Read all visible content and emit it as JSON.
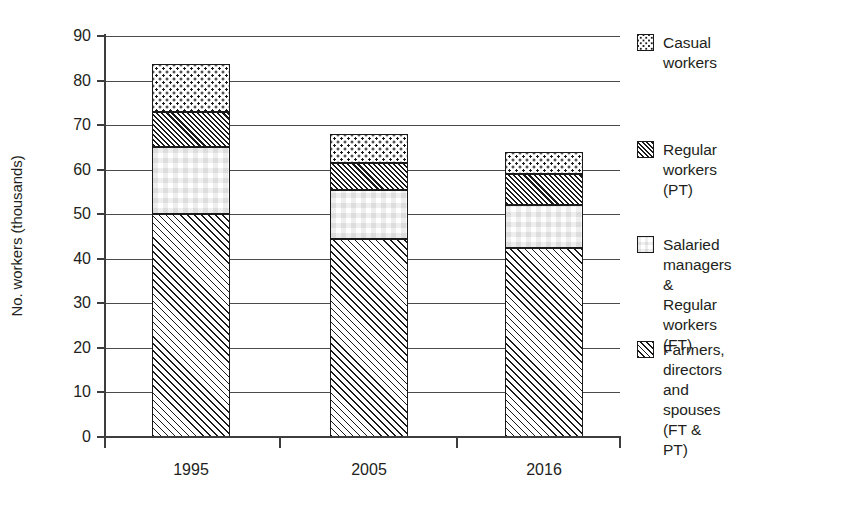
{
  "chart_data": {
    "type": "bar",
    "stacked": true,
    "title": "",
    "xlabel": "",
    "ylabel": "No. workers (thousands)",
    "categories": [
      "1995",
      "2005",
      "2016"
    ],
    "ylim": [
      0,
      90
    ],
    "ytick_step": 10,
    "yticks": [
      "90",
      "80",
      "70",
      "60",
      "50",
      "40",
      "30",
      "20",
      "10",
      "0"
    ],
    "ytick_values": [
      90,
      80,
      70,
      60,
      50,
      40,
      30,
      20,
      10,
      0
    ],
    "grid": "horizontal",
    "legend_position": "right",
    "series": [
      {
        "name": "Farmers, directors and spouses (FT & PT)",
        "legend_label": "Farmers, directors\nand spouses (FT &\nPT)",
        "pattern": "light-diagonal-hatch",
        "values": [
          50.0,
          44.5,
          42.5
        ]
      },
      {
        "name": "Salaried managers & Regular workers (FT)",
        "legend_label": "Salaried managers &\nRegular workers (FT)",
        "pattern": "checkerboard",
        "values": [
          15.0,
          11.0,
          9.5
        ]
      },
      {
        "name": "Regular workers (PT)",
        "legend_label": "Regular workers (PT)",
        "pattern": "dense-diagonal-hatch",
        "values": [
          8.0,
          6.0,
          7.0
        ]
      },
      {
        "name": "Casual workers",
        "legend_label": "Casual workers",
        "pattern": "dotted-grid",
        "values": [
          10.7,
          6.5,
          5.0
        ]
      }
    ],
    "totals": [
      83.7,
      68.0,
      64.0
    ],
    "cumulative_tops": {
      "1995": [
        50.0,
        65.0,
        73.0,
        83.7
      ],
      "2005": [
        44.5,
        55.5,
        61.5,
        68.0
      ],
      "2016": [
        42.5,
        52.0,
        59.0,
        64.0
      ]
    },
    "colors": {
      "ink": "#231f20",
      "line": "#3d3d3d",
      "grid": "#4a4a4a",
      "pattern_fg": "#1a1a1a",
      "pattern_bg": "#ffffff",
      "background": "#ffffff"
    }
  },
  "legend": {
    "items": [
      {
        "label": "Casual workers",
        "swatch": "dotted-grid-swatch"
      },
      {
        "label": "Regular workers (PT)",
        "swatch": "dense-diagonal-hatch-swatch"
      },
      {
        "label": "Salaried managers &\nRegular workers (FT)",
        "swatch": "checkerboard-swatch"
      },
      {
        "label": "Farmers, directors\nand spouses (FT &\nPT)",
        "swatch": "light-diagonal-hatch-swatch"
      }
    ]
  }
}
